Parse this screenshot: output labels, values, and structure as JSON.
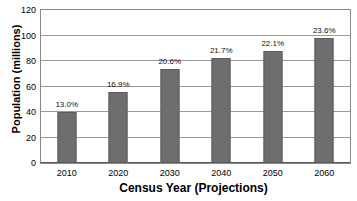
{
  "chart_data": {
    "type": "bar",
    "title": "",
    "xlabel": "Census Year (Projections)",
    "ylabel": "Population (millions)",
    "categories": [
      "2010",
      "2020",
      "2030",
      "2040",
      "2050",
      "2060"
    ],
    "values": [
      40,
      56,
      74,
      82,
      88,
      98
    ],
    "point_labels": [
      "13.0%",
      "16.9%",
      "20.6%",
      "21.7%",
      "22.1%",
      "23.6%"
    ],
    "ylim": [
      0,
      120
    ],
    "yticks": [
      0,
      20,
      40,
      60,
      80,
      100,
      120
    ],
    "ytick_labels": [
      "0",
      "20",
      "40",
      "60",
      "80",
      "100",
      "120"
    ],
    "grid": true,
    "grid_axis": "y",
    "legend": false,
    "legend_position": "none",
    "colors": {
      "bar_fill": "#6e6e6e",
      "bar_border": "#5c5c5c",
      "gridline": "#9a9a9a",
      "frame": "#8a8a8a",
      "text": "#000000",
      "background": "#ffffff"
    }
  }
}
